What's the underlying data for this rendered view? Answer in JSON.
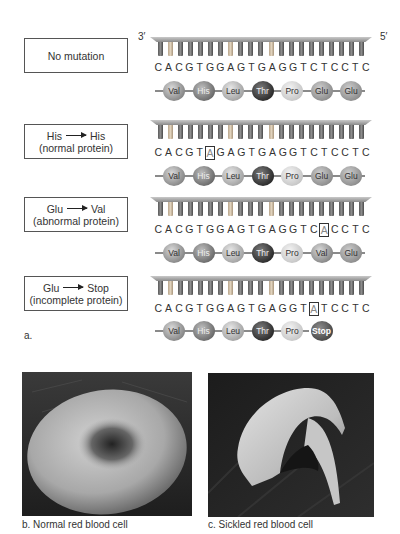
{
  "strand_ends": {
    "left": "3′",
    "right": "5′"
  },
  "rows": [
    {
      "label_lines": [
        "No mutation"
      ],
      "sequence": [
        "C",
        "A",
        "C",
        "G",
        "T",
        "G",
        "G",
        "A",
        "G",
        "T",
        "G",
        "A",
        "G",
        "G",
        "T",
        "C",
        "T",
        "C",
        "C",
        "T",
        "C"
      ],
      "highlight_index": -1,
      "amino_acids": [
        "Val",
        "His",
        "Leu",
        "Thr",
        "Pro",
        "Glu",
        "Glu"
      ]
    },
    {
      "label_from": "His",
      "label_to": "His",
      "label_note": "(normal protein)",
      "sequence": [
        "C",
        "A",
        "C",
        "G",
        "T",
        "A",
        "G",
        "A",
        "G",
        "T",
        "G",
        "A",
        "G",
        "G",
        "T",
        "C",
        "T",
        "C",
        "C",
        "T",
        "C"
      ],
      "highlight_index": 5,
      "amino_acids": [
        "Val",
        "His",
        "Leu",
        "Thr",
        "Pro",
        "Glu",
        "Glu"
      ]
    },
    {
      "label_from": "Glu",
      "label_to": "Val",
      "label_note": "(abnormal protein)",
      "sequence": [
        "C",
        "A",
        "C",
        "G",
        "T",
        "G",
        "G",
        "A",
        "G",
        "T",
        "G",
        "A",
        "G",
        "G",
        "T",
        "C",
        "A",
        "C",
        "C",
        "T",
        "C"
      ],
      "highlight_index": 16,
      "amino_acids": [
        "Val",
        "His",
        "Leu",
        "Thr",
        "Pro",
        "Val",
        "Glu"
      ]
    },
    {
      "label_from": "Glu",
      "label_to": "Stop",
      "label_note": "(incomplete protein)",
      "sequence": [
        "C",
        "A",
        "C",
        "G",
        "T",
        "G",
        "G",
        "A",
        "G",
        "T",
        "G",
        "A",
        "G",
        "G",
        "T",
        "A",
        "T",
        "C",
        "C",
        "T",
        "C"
      ],
      "highlight_index": 15,
      "amino_acids": [
        "Val",
        "His",
        "Leu",
        "Thr",
        "Pro",
        "Stop"
      ]
    }
  ],
  "part_a_label": "a.",
  "photos": [
    {
      "caption": "b. Normal red blood cell",
      "subject": "normal-red-blood-cell"
    },
    {
      "caption": "c. Sickled red blood cell",
      "subject": "sickled-red-blood-cell"
    }
  ]
}
